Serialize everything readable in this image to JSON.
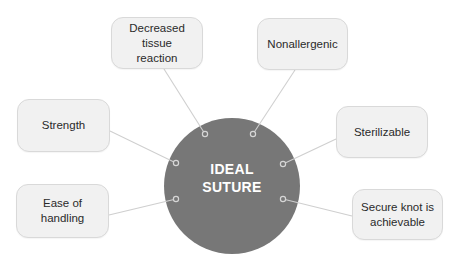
{
  "diagram": {
    "type": "mind-map",
    "center": {
      "line1": "IDEAL",
      "line2": "SUTURE",
      "fill": "#777777",
      "text_color": "#ffffff"
    },
    "nodes": [
      {
        "id": "decreased-tissue-reaction",
        "line1": "Decreased tissue",
        "line2": "reaction"
      },
      {
        "id": "nonallergenic",
        "line1": "Nonallergenic",
        "line2": ""
      },
      {
        "id": "strength",
        "line1": "Strength",
        "line2": ""
      },
      {
        "id": "sterilizable",
        "line1": "Sterilizable",
        "line2": ""
      },
      {
        "id": "ease-of-handling",
        "line1": "Ease of",
        "line2": "handling"
      },
      {
        "id": "secure-knot",
        "line1": "Secure knot is",
        "line2": "achievable"
      }
    ],
    "colors": {
      "box_fill": "#f1f1f1",
      "box_border": "#d9d9d9",
      "connector": "#cfcfcf",
      "hub": "#777777"
    }
  }
}
